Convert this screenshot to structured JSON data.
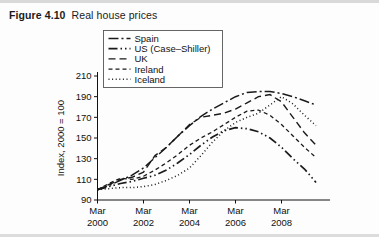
{
  "figure": {
    "number": "Figure 4.10",
    "title": "Real house prices"
  },
  "chart_data": {
    "type": "line",
    "title": "Real house prices",
    "xlabel": "",
    "ylabel": "Index, 2000 = 100",
    "ylim": [
      90,
      210
    ],
    "ytick_labels": [
      "90",
      "110",
      "130",
      "150",
      "170",
      "190",
      "210"
    ],
    "yticks": [
      90,
      110,
      130,
      150,
      170,
      190,
      210
    ],
    "xtick_labels": [
      {
        "line1": "Mar",
        "line2": "2000"
      },
      {
        "line1": "Mar",
        "line2": "2002"
      },
      {
        "line1": "Mar",
        "line2": "2004"
      },
      {
        "line1": "Mar",
        "line2": "2006"
      },
      {
        "line1": "Mar",
        "line2": "2008"
      }
    ],
    "xticks": [
      2000.2,
      2002.2,
      2004.2,
      2006.2,
      2008.2
    ],
    "xlim": [
      2000.2,
      2009.7
    ],
    "grid": false,
    "legend_position": "top-center",
    "line_color": "#1a1a1a",
    "series": [
      {
        "name": "Spain",
        "dash": "10,3,2,3",
        "width": 1.5,
        "x": [
          2000.2,
          2000.7,
          2001.2,
          2001.7,
          2002.2,
          2002.7,
          2003.2,
          2003.7,
          2004.2,
          2004.7,
          2005.2,
          2005.7,
          2006.2,
          2006.7,
          2007.2,
          2007.7,
          2008.2,
          2008.7,
          2009.2,
          2009.7
        ],
        "values": [
          100,
          104,
          109,
          114,
          121,
          131,
          141,
          152,
          162,
          171,
          178,
          184,
          190,
          194,
          195,
          195,
          193,
          190,
          186,
          182
        ]
      },
      {
        "name": "US (Case–Shiller)",
        "dash": "9,3,1.5,3,1.5,3",
        "width": 1.7,
        "x": [
          2000.2,
          2000.7,
          2001.2,
          2001.7,
          2002.2,
          2002.7,
          2003.2,
          2003.7,
          2004.2,
          2004.7,
          2005.2,
          2005.7,
          2006.2,
          2006.7,
          2007.2,
          2007.7,
          2008.2,
          2008.7,
          2009.2,
          2009.7
        ],
        "values": [
          100,
          103,
          106,
          108,
          111,
          114,
          119,
          126,
          134,
          143,
          151,
          157,
          160,
          159,
          156,
          150,
          141,
          130,
          120,
          107
        ]
      },
      {
        "name": "UK",
        "dash": "7,4",
        "width": 1.4,
        "x": [
          2000.2,
          2000.7,
          2001.2,
          2001.7,
          2002.2,
          2002.7,
          2003.2,
          2003.7,
          2004.2,
          2004.7,
          2005.2,
          2005.7,
          2006.2,
          2006.7,
          2007.2,
          2007.7,
          2008.2,
          2008.7,
          2009.2,
          2009.7
        ],
        "values": [
          100,
          105,
          110,
          112,
          117,
          133,
          141,
          152,
          163,
          170,
          172,
          174,
          178,
          184,
          190,
          192,
          185,
          170,
          155,
          143
        ]
      },
      {
        "name": "Ireland",
        "dash": "4,3",
        "width": 1.3,
        "x": [
          2000.2,
          2000.7,
          2001.2,
          2001.7,
          2002.2,
          2002.7,
          2003.2,
          2003.7,
          2004.2,
          2004.7,
          2005.2,
          2005.7,
          2006.2,
          2006.7,
          2007.2,
          2007.7,
          2008.2,
          2008.7,
          2009.2,
          2009.7
        ],
        "values": [
          100,
          106,
          111,
          110,
          113,
          119,
          126,
          134,
          143,
          150,
          156,
          163,
          170,
          176,
          177,
          172,
          163,
          152,
          141,
          131
        ]
      },
      {
        "name": "Iceland",
        "dash": "1,2.6",
        "width": 1.5,
        "x": [
          2000.2,
          2000.7,
          2001.2,
          2001.7,
          2002.2,
          2002.7,
          2003.2,
          2003.7,
          2004.2,
          2004.7,
          2005.2,
          2005.7,
          2006.2,
          2006.7,
          2007.2,
          2007.7,
          2008.2,
          2008.7,
          2009.2,
          2009.7
        ],
        "values": [
          100,
          101,
          102,
          102,
          103,
          105,
          109,
          114,
          121,
          133,
          146,
          157,
          165,
          170,
          174,
          182,
          190,
          183,
          172,
          162
        ]
      }
    ]
  }
}
